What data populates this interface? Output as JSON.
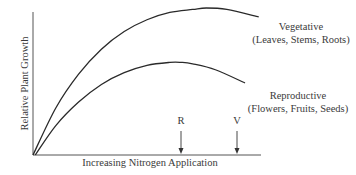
{
  "chart_data": {
    "type": "line",
    "title": "",
    "xlabel": "Increasing Nitrogen Application",
    "ylabel": "Relative Plant Growth",
    "grid": false,
    "legend": "direct labels at curve ends",
    "x_range": [
      0,
      1
    ],
    "y_range": [
      0,
      1
    ],
    "series": [
      {
        "name": "Vegetative",
        "sublabel": "(Leaves, Stems, Roots)",
        "x": [
          0,
          0.1,
          0.2,
          0.3,
          0.4,
          0.5,
          0.6,
          0.7,
          0.76,
          0.85,
          0.99
        ],
        "y": [
          0,
          0.32,
          0.55,
          0.72,
          0.84,
          0.92,
          0.97,
          0.99,
          1.0,
          0.99,
          0.94
        ]
      },
      {
        "name": "Reproductive",
        "sublabel": "(Flowers, Fruits, Seeds)",
        "x": [
          0.01,
          0.1,
          0.2,
          0.3,
          0.4,
          0.5,
          0.6,
          0.65,
          0.7,
          0.8,
          0.93
        ],
        "y": [
          0,
          0.2,
          0.36,
          0.48,
          0.56,
          0.61,
          0.63,
          0.63,
          0.62,
          0.58,
          0.49
        ]
      }
    ],
    "annotations": [
      {
        "label": "R",
        "x": 0.65,
        "meaning": "optimum N for reproductive growth",
        "type": "down-arrow to x-axis"
      },
      {
        "label": "V",
        "x": 0.89,
        "meaning": "optimum N for vegetative growth",
        "type": "down-arrow to x-axis"
      }
    ]
  },
  "labels": {
    "ylabel": "Relative Plant Growth",
    "xlabel": "Increasing Nitrogen Application",
    "veg_title": "Vegetative",
    "veg_sub": "(Leaves, Stems, Roots)",
    "rep_title": "Reproductive",
    "rep_sub": "(Flowers, Fruits, Seeds)",
    "mark_r": "R",
    "mark_v": "V"
  },
  "colors": {
    "line": "#2a2a2a",
    "text": "#3a3a3a",
    "background": "#ffffff"
  }
}
